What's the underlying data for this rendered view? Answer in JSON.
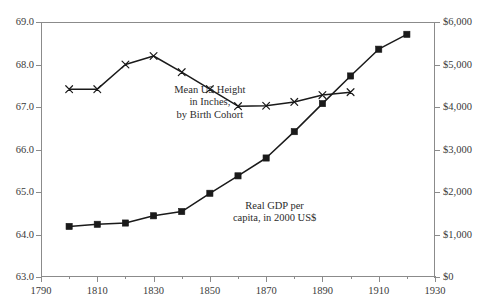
{
  "chart_data": {
    "type": "line",
    "title": "",
    "subtitle": "",
    "xlabel": "",
    "ylabel": "",
    "xlim": [
      1790,
      1930
    ],
    "grid": false,
    "legend_position": "inline-annotations",
    "x_ticks": [
      "1790",
      "1810",
      "1830",
      "1850",
      "1870",
      "1890",
      "1910",
      "1930"
    ],
    "x_tick_values": [
      1790,
      1810,
      1830,
      1850,
      1870,
      1890,
      1910,
      1930
    ],
    "x_minor_tick_values": [
      1800,
      1820,
      1840,
      1860,
      1880,
      1900,
      1920
    ],
    "axes": [
      {
        "id": "left",
        "label": "Mean US Height in Inches",
        "ylim": [
          63.0,
          69.0
        ],
        "ticks": [
          "63.0",
          "64.0",
          "65.0",
          "66.0",
          "67.0",
          "68.0",
          "69.0"
        ],
        "tick_values": [
          63.0,
          64.0,
          65.0,
          66.0,
          67.0,
          68.0,
          69.0
        ]
      },
      {
        "id": "right",
        "label": "Real GDP per capita, in 2000 US$",
        "ylim": [
          0,
          6000
        ],
        "ticks": [
          "$0",
          "$1,000",
          "$2,000",
          "$3,000",
          "$4,000",
          "$5,000",
          "$6,000"
        ],
        "tick_values": [
          0,
          1000,
          2000,
          3000,
          4000,
          5000,
          6000
        ]
      }
    ],
    "series": [
      {
        "name": "Mean US Height in Inches, by Birth Cohort",
        "axis": "left",
        "marker": "x",
        "color": "#1a1a1a",
        "x": [
          1800,
          1810,
          1820,
          1830,
          1840,
          1850,
          1860,
          1870,
          1880,
          1890,
          1900
        ],
        "values": [
          67.42,
          67.42,
          68.0,
          68.2,
          67.82,
          67.42,
          67.02,
          67.03,
          67.12,
          67.28,
          67.35
        ]
      },
      {
        "name": "Real GDP per capita, in 2000 US$",
        "axis": "right",
        "marker": "square",
        "color": "#1a1a1a",
        "x": [
          1800,
          1810,
          1820,
          1830,
          1840,
          1850,
          1860,
          1870,
          1880,
          1890,
          1900,
          1910,
          1920
        ],
        "values": [
          1190,
          1240,
          1270,
          1440,
          1540,
          1970,
          2380,
          2800,
          3420,
          4080,
          4730,
          5360,
          5710
        ]
      }
    ],
    "annotations": [
      {
        "id": "height-label",
        "lines": [
          "Mean US Height",
          "in Inches,",
          "by Birth Cohort"
        ],
        "x": 1850,
        "y_axis": "left",
        "y": 67.55
      },
      {
        "id": "gdp-label",
        "lines": [
          "Real GDP per",
          "capita, in 2000 US$"
        ],
        "x": 1873,
        "y_axis": "right",
        "y": 1820
      }
    ]
  },
  "style": {
    "axis_color": "#8b8b8b",
    "series_color": "#1a1a1a",
    "text_color": "#2b2b2b",
    "background": "#ffffff"
  }
}
